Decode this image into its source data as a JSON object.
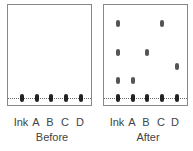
{
  "panels": [
    {
      "title": "Before",
      "lanes": [
        "Ink",
        "A",
        "B",
        "C",
        "D"
      ]
    },
    {
      "title": "After",
      "lanes": [
        "Ink",
        "A",
        "B",
        "C",
        "D"
      ]
    }
  ],
  "colors": {
    "border": "#888888",
    "spot": "#222222",
    "text": "#444444"
  }
}
